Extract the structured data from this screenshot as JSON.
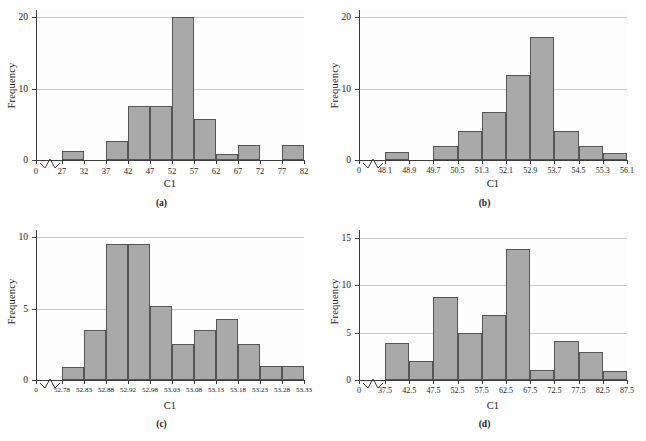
{
  "figure": {
    "panels": [
      {
        "caption": "(a)",
        "xlabel": "C1",
        "ylabel": "Frequency",
        "chart_data": {
          "type": "bar",
          "title": "",
          "xlabel": "C1",
          "ylabel": "Frequency",
          "grid": true,
          "legend": "none",
          "ylim": [
            0,
            21
          ],
          "yticks": [
            0,
            10,
            20
          ],
          "ytick_labels": [
            "0",
            "10",
            "20"
          ],
          "axis_break_x": true,
          "bin_edges": [
            27,
            32,
            37,
            42,
            47,
            52,
            57,
            62,
            67,
            72,
            77,
            82
          ],
          "xtick_labels": [
            "0",
            "27",
            "32",
            "37",
            "42",
            "47",
            "52",
            "57",
            "62",
            "67",
            "72",
            "77",
            "82"
          ],
          "categories": [
            "27-32",
            "32-37",
            "37-42",
            "42-47",
            "47-52",
            "52-57",
            "57-62",
            "62-67",
            "67-72",
            "72-77",
            "77-82"
          ],
          "values": [
            1.2,
            0,
            2.6,
            7.6,
            7.6,
            20,
            5.7,
            0.9,
            2.1,
            0,
            2.1
          ]
        }
      },
      {
        "caption": "(b)",
        "xlabel": "C1",
        "ylabel": "Frequency",
        "chart_data": {
          "type": "bar",
          "title": "",
          "xlabel": "C1",
          "ylabel": "Frequency",
          "grid": true,
          "legend": "none",
          "ylim": [
            0,
            21
          ],
          "yticks": [
            0,
            10,
            20
          ],
          "ytick_labels": [
            "0",
            "10",
            "20"
          ],
          "axis_break_x": true,
          "bin_edges": [
            48.1,
            48.9,
            49.7,
            50.5,
            51.3,
            52.1,
            52.9,
            53.7,
            54.5,
            55.3,
            56.1
          ],
          "xtick_labels": [
            "0",
            "48.1",
            "48.9",
            "49.7",
            "50.5",
            "51.3",
            "52.1",
            "52.9",
            "53.7",
            "54.5",
            "55.3",
            "56.1"
          ],
          "categories": [
            "48.1-48.9",
            "48.9-49.7",
            "49.7-50.5",
            "50.5-51.3",
            "51.3-52.1",
            "52.1-52.9",
            "52.9-53.7",
            "53.7-54.5",
            "54.5-55.3",
            "55.3-56.1"
          ],
          "values": [
            1.1,
            0,
            2.0,
            4.0,
            6.7,
            11.9,
            17.2,
            4.0,
            2.0,
            1.0
          ]
        }
      },
      {
        "caption": "(c)",
        "xlabel": "C1",
        "ylabel": "Frequency",
        "chart_data": {
          "type": "bar",
          "title": "",
          "xlabel": "C1",
          "ylabel": "Frequency",
          "grid": true,
          "legend": "none",
          "ylim": [
            0,
            10.5
          ],
          "yticks": [
            0,
            5,
            10
          ],
          "ytick_labels": [
            "0",
            "5",
            "10"
          ],
          "axis_break_x": true,
          "bin_edges": [
            52.78,
            52.83,
            52.88,
            52.92,
            52.98,
            53.03,
            53.08,
            53.13,
            53.18,
            53.23,
            53.28,
            53.33
          ],
          "xtick_labels": [
            "0",
            "52.78",
            "52.83",
            "52.88",
            "52.92",
            "52.98",
            "53.03",
            "53.08",
            "53.13",
            "53.18",
            "53.23",
            "53.28",
            "53.33"
          ],
          "categories": [
            "52.78-52.83",
            "52.83-52.88",
            "52.88-52.92",
            "52.92-52.98",
            "52.98-53.03",
            "53.03-53.08",
            "53.08-53.13",
            "53.13-53.18",
            "53.18-53.23",
            "53.23-53.28",
            "53.28-53.33"
          ],
          "values": [
            0.9,
            3.5,
            9.5,
            9.5,
            5.2,
            2.5,
            3.5,
            4.3,
            2.5,
            1.0,
            1.0
          ]
        }
      },
      {
        "caption": "(d)",
        "xlabel": "C1",
        "ylabel": "Frequency",
        "chart_data": {
          "type": "bar",
          "title": "",
          "xlabel": "C1",
          "ylabel": "Frequency",
          "grid": true,
          "legend": "none",
          "ylim": [
            0,
            15.8
          ],
          "yticks": [
            0,
            5,
            10,
            15
          ],
          "ytick_labels": [
            "0",
            "5",
            "10",
            "15"
          ],
          "axis_break_x": true,
          "bin_edges": [
            37.5,
            42.5,
            47.5,
            52.5,
            57.5,
            62.5,
            67.5,
            72.5,
            77.5,
            82.5,
            87.5
          ],
          "xtick_labels": [
            "0",
            "37.5",
            "42.5",
            "47.5",
            "52.5",
            "57.5",
            "62.5",
            "67.5",
            "72.5",
            "77.5",
            "82.5",
            "87.5"
          ],
          "categories": [
            "37.5-42.5",
            "42.5-47.5",
            "47.5-52.5",
            "52.5-57.5",
            "57.5-62.5",
            "62.5-67.5",
            "67.5-72.5",
            "72.5-77.5",
            "77.5-82.5",
            "82.5-87.5"
          ],
          "values": [
            3.9,
            2.0,
            8.7,
            5.0,
            6.8,
            13.8,
            1.1,
            4.1,
            2.9,
            1.0
          ]
        }
      }
    ]
  },
  "style": {
    "bar_fill": "#a9a9a9",
    "bar_stroke": "#555555",
    "grid_color": "#c9c9c9",
    "axis_color": "#3b3b3b",
    "plot_background": "#fdfdfd",
    "page_background": "#ffffff"
  }
}
